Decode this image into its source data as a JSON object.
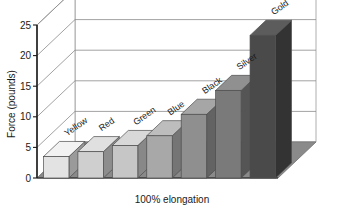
{
  "chart_data": {
    "type": "bar",
    "title": "",
    "subtitle": "",
    "xlabel": "100% elongation",
    "ylabel": "Force (pounds)",
    "categories": [
      "Yellow",
      "Red",
      "Green",
      "Blue",
      "Black",
      "Silver",
      "Gold"
    ],
    "values": [
      3.5,
      4.3,
      5.3,
      6.9,
      10.4,
      14.3,
      23.3
    ],
    "series": [
      {
        "name": "Force",
        "values": [
          3.5,
          4.3,
          5.3,
          6.9,
          10.4,
          14.3,
          23.3
        ]
      }
    ],
    "ylim": [
      0,
      25
    ],
    "xlim": [
      0,
      7
    ],
    "yticks": [
      0,
      5,
      10,
      15,
      20,
      25
    ],
    "ytick_labels": [
      "0",
      "5",
      "10",
      "15",
      "20",
      "25"
    ],
    "grid": true,
    "grid_axis": "y",
    "legend": false,
    "legend_position": "none",
    "projection": "3d",
    "bar_colors": [
      "#e3e3e3",
      "#cfcfcf",
      "#c6c6c6",
      "#a8a8a8",
      "#8f8f8f",
      "#7a7a7a",
      "#4a4a4a"
    ],
    "bar_side_colors": [
      "#9a9a9a",
      "#8d8d8d",
      "#888888",
      "#757575",
      "#636363",
      "#555555",
      "#333333"
    ],
    "bar_top_colors": [
      "#f2f2f2",
      "#e0e0e0",
      "#d8d8d8",
      "#bdbdbd",
      "#a6a6a6",
      "#909090",
      "#5c5c5c"
    ],
    "label_rotation_deg": -35,
    "floor_color": "#8a8a8a",
    "wall_color": "#ffffff",
    "axis_color": "#1a1a1a",
    "grid_color": "#8a8a8a",
    "annotations": []
  },
  "axes": {
    "y_title": "Force (pounds)",
    "x_title": "100% elongation"
  }
}
